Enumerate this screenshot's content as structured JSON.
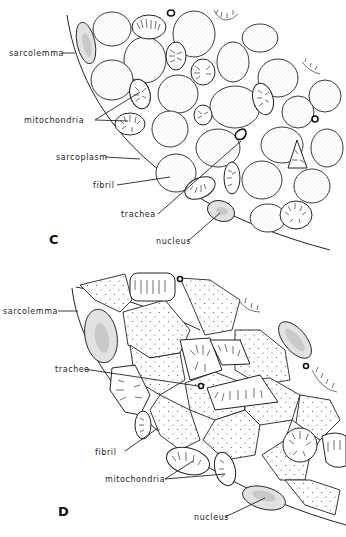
{
  "figure": {
    "panels": [
      {
        "id": "C",
        "label": "C",
        "annotations": {
          "sarcolemma": "sarcolemma",
          "mitochondria": "mitochondria",
          "sarcoplasm": "sarcoplasm",
          "fibril": "fibril",
          "trachea": "trachea",
          "nucleus": "nucleus"
        }
      },
      {
        "id": "D",
        "label": "D",
        "annotations": {
          "sarcolemma": "sarcolemma",
          "trachea": "trachea",
          "fibril": "fibril",
          "mitochondria": "mitochondria",
          "nucleus": "nucleus"
        }
      }
    ]
  }
}
